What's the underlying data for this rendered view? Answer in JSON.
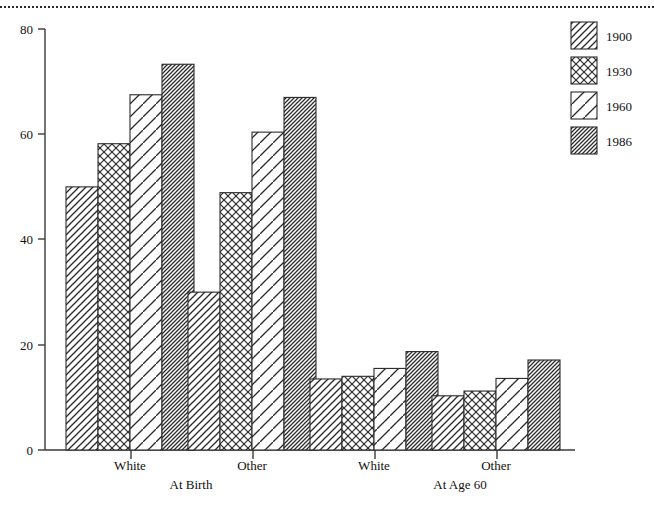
{
  "chart_data": {
    "type": "bar",
    "title": "",
    "subtitle": "",
    "xlabel": "",
    "ylabel": "",
    "ylim": [
      0,
      80
    ],
    "yticks": [
      0,
      20,
      40,
      60,
      80
    ],
    "ytick_labels": [
      "0",
      "20",
      "40",
      "60",
      "80"
    ],
    "grid": false,
    "legend_position": "top-right",
    "orientation": "vertical",
    "bar_gap_within_group": 0,
    "categories": [
      "White",
      "Other",
      "White",
      "Other"
    ],
    "group_labels": [
      "At Birth",
      "At Age 60"
    ],
    "groups": [
      {
        "panel": "At Birth",
        "category": "White",
        "values": [
          50.0,
          58.2,
          67.5,
          73.3
        ]
      },
      {
        "panel": "At Birth",
        "category": "Other",
        "values": [
          30.0,
          48.9,
          60.4,
          67.0
        ]
      },
      {
        "panel": "At Age 60",
        "category": "White",
        "values": [
          13.5,
          14.0,
          15.5,
          18.7
        ]
      },
      {
        "panel": "At Age 60",
        "category": "Other",
        "values": [
          10.3,
          11.2,
          13.6,
          17.1
        ]
      }
    ],
    "series": [
      {
        "name": "1900",
        "pattern": "diagonal-medium",
        "values": [
          50.0,
          30.0,
          13.5,
          10.3
        ]
      },
      {
        "name": "1930",
        "pattern": "crosshatch",
        "values": [
          58.2,
          48.9,
          14.0,
          11.2
        ]
      },
      {
        "name": "1960",
        "pattern": "diagonal-sparse",
        "values": [
          67.5,
          60.4,
          15.5,
          13.6
        ]
      },
      {
        "name": "1986",
        "pattern": "diagonal-dense",
        "values": [
          73.3,
          67.0,
          18.7,
          17.1
        ]
      }
    ],
    "legend": [
      {
        "label": "1900",
        "pattern": "diagonal-medium"
      },
      {
        "label": "1930",
        "pattern": "crosshatch"
      },
      {
        "label": "1960",
        "pattern": "diagonal-sparse"
      },
      {
        "label": "1986",
        "pattern": "diagonal-dense"
      }
    ],
    "colors": {
      "axis": "#3a3a3a",
      "bar_outline": "#2a2a2a",
      "bar_fill": "#ffffff",
      "hatch": "#2a2a2a",
      "background": "#ffffff",
      "rule": "#2b2b2b"
    }
  }
}
